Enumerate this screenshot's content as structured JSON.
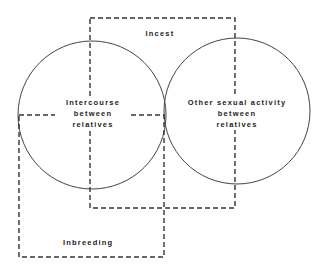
{
  "diagram": {
    "type": "venn-with-overlapping-dashed-regions",
    "circles": [
      {
        "id": "intercourse",
        "lines": [
          "Intercourse",
          "between",
          "relatives"
        ]
      },
      {
        "id": "other-sexual-activity",
        "lines": [
          "Other sexual activity",
          "between",
          "relatives"
        ]
      }
    ],
    "regions": [
      {
        "id": "incest",
        "label": "Incest"
      },
      {
        "id": "inbreeding",
        "label": "Inbreeding"
      }
    ],
    "colors": {
      "stroke": "#333333",
      "text": "#222222",
      "background": "#ffffff"
    }
  }
}
